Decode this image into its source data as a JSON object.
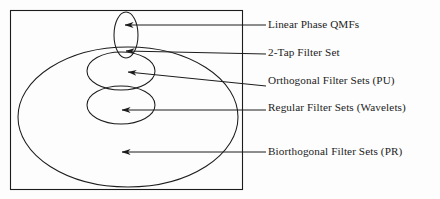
{
  "diagram": {
    "type": "venn-nested-set-diagram",
    "background_color": "#fdfdfd",
    "stroke_color": "#1c1c1c",
    "universe": {
      "name": "universe-rectangle",
      "shape": "rect",
      "x": 10,
      "y": 10,
      "width": 232,
      "height": 179
    },
    "regions": [
      {
        "id": "linear-phase-qmfs",
        "label": "Linear Phase QMFs",
        "shape": "ellipse",
        "cx": 126,
        "cy": 35,
        "rx": 12,
        "ry": 23,
        "arrow": {
          "x1": 266,
          "y1": 25,
          "x2": 125,
          "y2": 25
        }
      },
      {
        "id": "two-tap-filter-set",
        "label": "2-Tap Filter Set",
        "shape": "intersection-marker",
        "cx": 127,
        "cy": 53,
        "arrow": {
          "x1": 266,
          "y1": 54,
          "x2": 126,
          "y2": 51
        }
      },
      {
        "id": "orthogonal-filter-sets",
        "label": "Orthogonal Filter Sets (PU)",
        "shape": "ellipse",
        "cx": 121,
        "cy": 71,
        "rx": 34,
        "ry": 19,
        "arrow": {
          "x1": 266,
          "y1": 86,
          "x2": 128,
          "y2": 72
        }
      },
      {
        "id": "regular-filter-sets",
        "label": "Regular Filter Sets (Wavelets)",
        "shape": "ellipse",
        "cx": 121,
        "cy": 105,
        "rx": 34,
        "ry": 19,
        "arrow": {
          "x1": 266,
          "y1": 110,
          "x2": 122,
          "y2": 110
        }
      },
      {
        "id": "biorthogonal-filter-sets",
        "label": "Biorthogonal Filter Sets (PR)",
        "shape": "ellipse",
        "cx": 128,
        "cy": 117,
        "rx": 110,
        "ry": 70,
        "arrow": {
          "x1": 266,
          "y1": 152,
          "x2": 122,
          "y2": 152
        }
      }
    ]
  }
}
